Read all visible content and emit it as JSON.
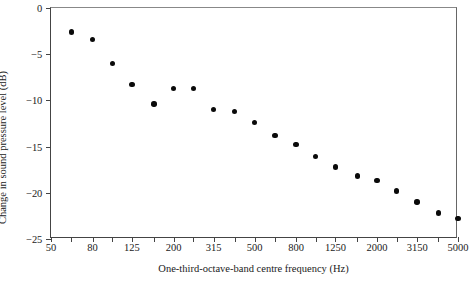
{
  "chart_data": {
    "type": "scatter",
    "title": "",
    "xlabel": "One-third-octave-band centre frequency (Hz)",
    "ylabel": "Change in sound pressure level  (dB)",
    "xscale": "log",
    "xlim": [
      50,
      5000
    ],
    "ylim": [
      -25,
      0
    ],
    "yticks": [
      0,
      -5,
      -10,
      -15,
      -20,
      -25
    ],
    "ytick_labels": [
      "0",
      "−5",
      "−10",
      "−15",
      "−20",
      "−25"
    ],
    "xticks": [
      50,
      63,
      80,
      100,
      125,
      160,
      200,
      250,
      315,
      400,
      500,
      630,
      800,
      1000,
      1250,
      1600,
      2000,
      2500,
      3150,
      4000,
      5000
    ],
    "xtick_labels": [
      "50",
      "",
      "80",
      "",
      "125",
      "",
      "200",
      "",
      "315",
      "",
      "500",
      "",
      "800",
      "",
      "1250",
      "",
      "2000",
      "",
      "3150",
      "",
      "5000"
    ],
    "grid": false,
    "legend": false,
    "marker": "filled-circle",
    "marker_color": "#0a0a0a",
    "x": [
      63,
      80,
      100,
      125,
      160,
      200,
      250,
      315,
      400,
      500,
      630,
      800,
      1000,
      1250,
      1600,
      2000,
      2500,
      3150,
      4000,
      5000
    ],
    "values": [
      -2.6,
      -3.4,
      -6.0,
      -8.3,
      -10.4,
      -8.7,
      -8.7,
      -11.0,
      -11.2,
      -12.4,
      -13.8,
      -14.8,
      -16.1,
      -17.2,
      -18.2,
      -18.7,
      -19.8,
      -21.0,
      -22.2,
      -22.8
    ],
    "points": [
      {
        "freq": 63,
        "db": -2.6
      },
      {
        "freq": 80,
        "db": -3.4
      },
      {
        "freq": 100,
        "db": -6.0
      },
      {
        "freq": 125,
        "db": -8.3
      },
      {
        "freq": 160,
        "db": -10.4
      },
      {
        "freq": 200,
        "db": -8.7
      },
      {
        "freq": 250,
        "db": -8.7
      },
      {
        "freq": 315,
        "db": -11.0
      },
      {
        "freq": 400,
        "db": -11.2
      },
      {
        "freq": 500,
        "db": -12.4
      },
      {
        "freq": 630,
        "db": -13.8
      },
      {
        "freq": 800,
        "db": -14.8
      },
      {
        "freq": 1000,
        "db": -16.1
      },
      {
        "freq": 1250,
        "db": -17.2
      },
      {
        "freq": 1600,
        "db": -18.2
      },
      {
        "freq": 2000,
        "db": -18.7
      },
      {
        "freq": 2500,
        "db": -19.8
      },
      {
        "freq": 3150,
        "db": -21.0
      },
      {
        "freq": 4000,
        "db": -22.2
      },
      {
        "freq": 5000,
        "db": -22.8
      }
    ]
  }
}
